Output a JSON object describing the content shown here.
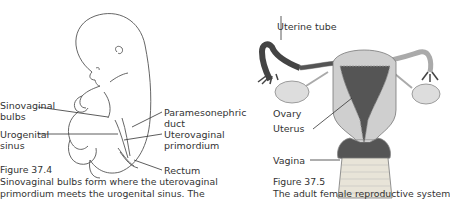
{
  "figure_left": {
    "labels": {
      "sinovaginal_bulbs_1": "Sinovaginal",
      "sinovaginal_bulbs_2": "bulbs",
      "urogenital_sinus_1": "Urogenital",
      "urogenital_sinus_2": "sinus",
      "paramesonephric_1": "Paramesonephric",
      "paramesonephric_2": "duct",
      "uterovaginal_1": "Uterovaginal",
      "uterovaginal_2": "primordium",
      "rectum": "Rectum"
    },
    "caption_number": "Figure 37.4",
    "caption_line1": "Sinovaginal bulbs form where the uterovaginal",
    "caption_line2": "primordium meets the urogenital sinus. The"
  },
  "figure_right": {
    "labels": {
      "uterine_tube": "Uterine tube",
      "ovary": "Ovary",
      "uterus": "Uterus",
      "vagina": "Vagina"
    },
    "caption_number": "Figure 37.5",
    "caption_line1": "The adult female reproductive system"
  }
}
